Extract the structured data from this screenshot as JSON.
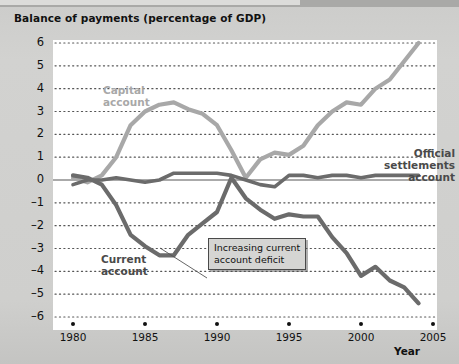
{
  "title": "Balance of payments (percentage of GDP)",
  "axis": {
    "x_title": "Year",
    "x_ticks": [
      "1980",
      "1985",
      "1990",
      "1995",
      "2000",
      "2005"
    ],
    "y_ticks": [
      "6",
      "5",
      "4",
      "3",
      "2",
      "1",
      "0",
      "–1",
      "–2",
      "–3",
      "–4",
      "–5",
      "–6"
    ]
  },
  "labels": {
    "capital": "Capital\naccount",
    "capital_line1": "Capital",
    "capital_line2": "account",
    "current_line1": "Current",
    "current_line2": "account",
    "official_line1": "Official",
    "official_line2": "settlements",
    "official_line3": "account"
  },
  "annotation": {
    "line1": "Increasing current",
    "line2": "account deficit"
  },
  "colors": {
    "capital": "#a8a8a8",
    "current": "#6b6b6b",
    "official": "#6b6b6b",
    "plot_background": "#ffffff",
    "page_background": "#cfcfcd",
    "grid": "#444444",
    "text": "#111111"
  },
  "chart_data": {
    "type": "line",
    "title": "Balance of payments (percentage of GDP)",
    "xlabel": "Year",
    "ylabel": "",
    "xlim": [
      1980,
      2005
    ],
    "ylim": [
      -6,
      6
    ],
    "grid": true,
    "legend": "inline-labels",
    "x": [
      1980,
      1981,
      1982,
      1983,
      1984,
      1985,
      1986,
      1987,
      1988,
      1989,
      1990,
      1991,
      1992,
      1993,
      1994,
      1995,
      1996,
      1997,
      1998,
      1999,
      2000,
      2001,
      2002,
      2003,
      2004
    ],
    "series": [
      {
        "name": "Capital account",
        "color": "#a8a8a8",
        "values": [
          0.1,
          -0.1,
          0.2,
          1.0,
          2.4,
          3.0,
          3.3,
          3.4,
          3.1,
          2.9,
          2.4,
          1.3,
          0.1,
          0.9,
          1.2,
          1.1,
          1.5,
          2.4,
          3.0,
          3.4,
          3.3,
          4.0,
          4.4,
          5.2,
          6.0
        ]
      },
      {
        "name": "Current account",
        "color": "#6b6b6b",
        "values": [
          0.2,
          0.1,
          -0.2,
          -1.1,
          -2.4,
          -2.9,
          -3.3,
          -3.3,
          -2.4,
          -1.9,
          -1.4,
          0.1,
          -0.8,
          -1.3,
          -1.7,
          -1.5,
          -1.6,
          -1.6,
          -2.5,
          -3.2,
          -4.2,
          -3.8,
          -4.4,
          -4.7,
          -5.4
        ]
      },
      {
        "name": "Official settlements account",
        "color": "#6b6b6b",
        "values": [
          -0.2,
          0.0,
          0.0,
          0.1,
          0.0,
          -0.1,
          0.0,
          0.3,
          0.3,
          0.3,
          0.3,
          0.2,
          0.0,
          -0.2,
          -0.3,
          0.2,
          0.2,
          0.1,
          0.2,
          0.2,
          0.1,
          0.2,
          0.2,
          0.2,
          0.2
        ]
      }
    ],
    "annotations": [
      {
        "text": "Increasing current account deficit",
        "points_to": [
          1988,
          -3.2
        ]
      }
    ]
  }
}
